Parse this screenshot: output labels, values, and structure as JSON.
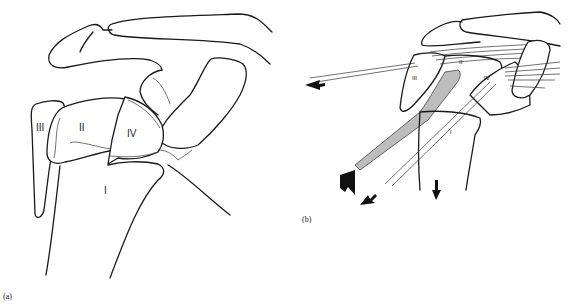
{
  "figure": {
    "panel_a": {
      "caption": "(a)",
      "fragment_labels": [
        "I",
        "II",
        "III",
        "IV"
      ]
    },
    "panel_b": {
      "caption": "(b)",
      "fragment_labels": [
        "I",
        "II",
        "III",
        "IV"
      ]
    }
  },
  "colors": {
    "line": "#1a1a1a",
    "shaft_fill": "#bdbdbd",
    "arrow_fill": "#111111",
    "background": "#ffffff"
  }
}
